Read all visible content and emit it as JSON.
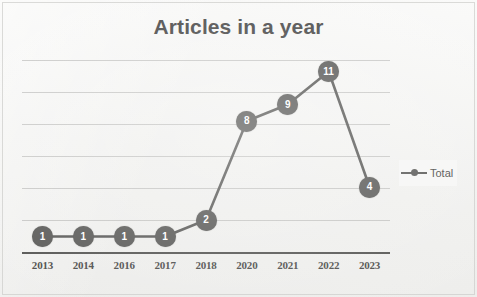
{
  "chart_data": {
    "type": "line",
    "title": "Articles in a year",
    "xlabel": "",
    "ylabel": "",
    "categories": [
      "2013",
      "2014",
      "2016",
      "2017",
      "2018",
      "2020",
      "2021",
      "2022",
      "2023"
    ],
    "values": [
      1,
      1,
      1,
      1,
      2,
      8,
      9,
      11,
      4
    ],
    "series": [
      {
        "name": "Total",
        "values": [
          1,
          1,
          1,
          1,
          2,
          8,
          9,
          11,
          4
        ]
      }
    ],
    "data_labels": [
      "1",
      "1",
      "1",
      "1",
      "2",
      "8",
      "9",
      "11",
      "4"
    ],
    "ylim": [
      0,
      12
    ],
    "yticks": [
      0,
      2,
      4,
      6,
      8,
      10,
      12
    ],
    "ytick_labels_visible": false,
    "gridlines": {
      "horizontal": true,
      "vertical": false,
      "count": 6
    },
    "legend": {
      "entries": [
        "Total"
      ],
      "position": "right",
      "symbol": "line-with-marker"
    },
    "colors": {
      "series_line": "#5a5a58",
      "marker_fill": "#5a5a58",
      "marker_label": "#ffffff",
      "title": "#474747",
      "gridline": "#a6a6a4",
      "axis": "#555553",
      "tick_label": "#4d4d4b",
      "background": "#f2f2f1"
    },
    "annotations": []
  },
  "legend": {
    "series_label": "Total"
  },
  "icons": {
    "legend_marker": "line-marker-icon"
  }
}
